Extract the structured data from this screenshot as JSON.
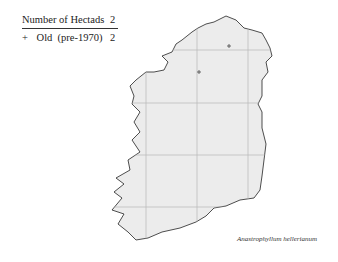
{
  "legend": {
    "title": "Number of Hectads",
    "total": "2",
    "rows": [
      {
        "symbol": "+",
        "label": "Old  (pre-1970)",
        "count": "2"
      }
    ]
  },
  "map": {
    "region": "Ireland",
    "fill_color": "#ececec",
    "coast_color": "#222222",
    "grid_color": "#b8b8b8",
    "records": [
      {
        "symbol": "+",
        "x": 229,
        "y": 46
      },
      {
        "symbol": "+",
        "x": 199,
        "y": 72
      }
    ]
  },
  "caption": "Anastrophyllum hellerianum"
}
